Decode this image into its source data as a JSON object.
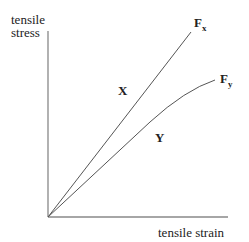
{
  "diagram": {
    "y_axis_label_line1": "tensile",
    "y_axis_label_line2": "stress",
    "x_axis_label": "tensile strain",
    "curves": [
      {
        "region_label": "X",
        "end_label": "F",
        "end_sub": "x",
        "shape": "straight line"
      },
      {
        "region_label": "Y",
        "end_label": "F",
        "end_sub": "y",
        "shape": "curve bending over"
      }
    ],
    "line_color": "#555555"
  }
}
